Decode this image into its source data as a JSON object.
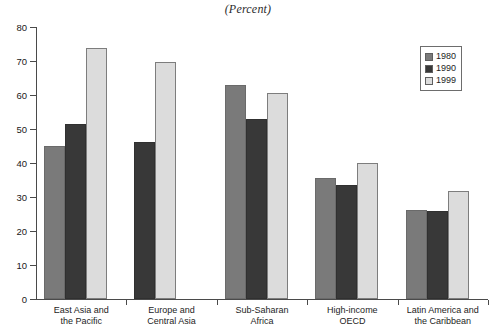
{
  "chart_data": {
    "type": "bar",
    "title": "(Percent)",
    "subtitle": "",
    "xlabel": "",
    "ylabel": "",
    "ylim": [
      0,
      80
    ],
    "yticks": [
      0,
      10,
      20,
      30,
      40,
      50,
      60,
      70,
      80
    ],
    "ytick_labels": [
      "0",
      "10",
      "20",
      "30",
      "40",
      "50",
      "60",
      "70",
      "80"
    ],
    "grid": false,
    "legend_position": "top-right",
    "categories": [
      "East Asia and\nthe Pacific",
      "Europe and\nCentral Asia",
      "Sub-Saharan\nAfrica",
      "High-income\nOECD",
      "Latin America and\nthe Caribbean"
    ],
    "series": [
      {
        "name": "1980",
        "color": "#7a7a7a",
        "values": [
          45.0,
          null,
          63.0,
          35.5,
          26.3
        ]
      },
      {
        "name": "1990",
        "color": "#383838",
        "values": [
          51.4,
          46.1,
          52.8,
          33.4,
          26.0
        ]
      },
      {
        "name": "1999",
        "color": "#dcdcdc",
        "values": [
          73.8,
          69.6,
          60.6,
          40.0,
          31.7
        ]
      }
    ]
  },
  "legend": {
    "entries": [
      {
        "label": "1980"
      },
      {
        "label": "1990"
      },
      {
        "label": "1999"
      }
    ]
  }
}
